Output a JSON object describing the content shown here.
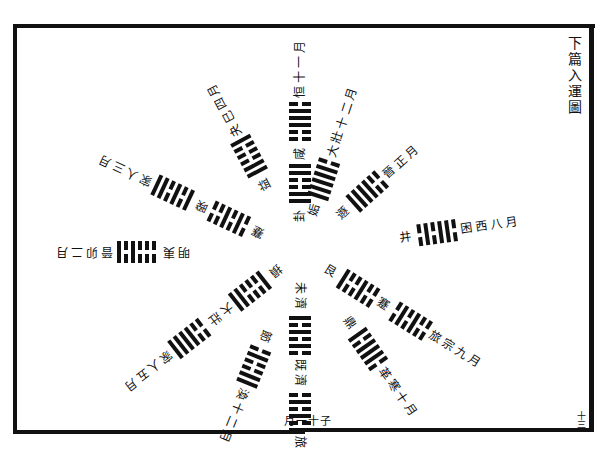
{
  "page": {
    "title": "下篇入運圖",
    "page_number": "十三",
    "bottom_label": "月一十子"
  },
  "spokes": [
    {
      "angle": -90,
      "start": 30,
      "inner_label": "卦",
      "hex1": [
        1,
        1,
        0,
        0,
        1,
        1
      ],
      "mid_label": "咸",
      "hex2": [
        0,
        0,
        1,
        1,
        1,
        0
      ],
      "outer_label": "恒",
      "tail_label": "十一月"
    },
    {
      "angle": -72,
      "start": 38,
      "inner_label": "姤",
      "hex1": [
        1,
        1,
        1,
        1,
        1,
        0
      ],
      "mid_label": "",
      "hex2": [],
      "outer_label": "大壯",
      "tail_label": "十二月"
    },
    {
      "angle": -42,
      "start": 52,
      "inner_label": "遯",
      "hex1": [
        1,
        1,
        1,
        1,
        0,
        0
      ],
      "mid_label": "",
      "hex2": [],
      "outer_label": "晉",
      "tail_label": "正月"
    },
    {
      "angle": -8,
      "start": 100,
      "inner_label": "井",
      "hex1": [
        0,
        1,
        0,
        1,
        1,
        0
      ],
      "mid_label": "",
      "hex2": [],
      "outer_label": "困",
      "tail_label": "西八月"
    },
    {
      "angle": 32,
      "start": 30,
      "inner_label": "艮",
      "hex1": [
        1,
        0,
        0,
        1,
        0,
        0
      ],
      "mid_label": "蹇",
      "hex2": [
        0,
        1,
        0,
        1,
        0,
        0
      ],
      "outer_label": "旅",
      "tail_label": "宗九月"
    },
    {
      "angle": 55,
      "start": 80,
      "inner_label": "鼎",
      "hex1": [
        1,
        0,
        1,
        1,
        1,
        0
      ],
      "mid_label": "",
      "hex2": [],
      "outer_label": "革",
      "tail_label": "寒十月"
    },
    {
      "angle": 90,
      "start": 30,
      "inner_label": "未濟",
      "hex1": [
        1,
        0,
        1,
        0,
        1,
        0
      ],
      "mid_label": "既濟",
      "hex2": [
        0,
        1,
        0,
        1,
        0,
        1
      ],
      "outer_label": "旅",
      "tail_label": ""
    },
    {
      "angle": 112,
      "start": 85,
      "inner_label": "節",
      "hex1": [
        0,
        1,
        0,
        0,
        1,
        1
      ],
      "mid_label": "",
      "hex2": [],
      "outer_label": "渙",
      "tail_label": "十二月"
    },
    {
      "angle": 142,
      "start": 25,
      "inner_label": "損",
      "hex1": [
        1,
        0,
        0,
        0,
        1,
        1
      ],
      "mid_label": "大壯",
      "hex2": [
        0,
        0,
        1,
        1,
        1,
        1
      ],
      "outer_label": "家人",
      "tail_label": "五月"
    },
    {
      "angle": 180,
      "start": 110,
      "inner_label": "明夷",
      "hex1": [
        0,
        0,
        0,
        1,
        0,
        1
      ],
      "mid_label": "",
      "hex2": [],
      "outer_label": "晉",
      "tail_label": "卯二月"
    },
    {
      "angle": -155,
      "start": 40,
      "inner_label": "蹇",
      "hex1": [
        0,
        1,
        0,
        1,
        0,
        0
      ],
      "mid_label": "暌",
      "hex2": [
        1,
        0,
        1,
        0,
        1,
        1
      ],
      "outer_label": "家人",
      "tail_label": "三月"
    },
    {
      "angle": -118,
      "start": 70,
      "inner_label": "益",
      "hex1": [
        1,
        1,
        0,
        0,
        0,
        1
      ],
      "mid_label": "",
      "hex2": [],
      "outer_label": "夬",
      "tail_label": "巳四月"
    }
  ]
}
